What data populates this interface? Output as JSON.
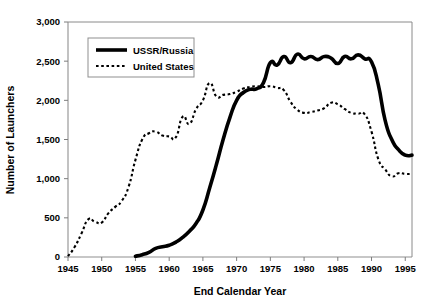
{
  "chart_data": {
    "type": "line",
    "title": "",
    "subtitle": "",
    "xlabel": "End Calendar Year",
    "ylabel": "Number of Launchers",
    "xlim": [
      1945,
      1996
    ],
    "ylim": [
      0,
      3000
    ],
    "xticks": [
      1945,
      1950,
      1955,
      1960,
      1965,
      1970,
      1975,
      1980,
      1985,
      1990,
      1995
    ],
    "xticklabels": [
      "1945",
      "1950",
      "1955",
      "1960",
      "1965",
      "1970",
      "1975",
      "1980",
      "1985",
      "1990",
      "1995"
    ],
    "yticks": [
      0,
      500,
      1000,
      1500,
      2000,
      2500,
      3000
    ],
    "yticklabels": [
      "0",
      "500",
      "1,000",
      "1,500",
      "2,000",
      "2,500",
      "3,000"
    ],
    "grid": false,
    "legend_position": "upper-left-inside",
    "series": [
      {
        "name": "USSR/Russia",
        "style": "solid",
        "linewidth": "thick",
        "color": "#000000",
        "x": [
          1955,
          1956,
          1957,
          1958,
          1959,
          1960,
          1961,
          1962,
          1963,
          1964,
          1965,
          1966,
          1967,
          1968,
          1969,
          1970,
          1971,
          1972,
          1973,
          1974,
          1975,
          1976,
          1977,
          1978,
          1979,
          1980,
          1981,
          1982,
          1983,
          1984,
          1985,
          1986,
          1987,
          1988,
          1989,
          1990,
          1991,
          1992,
          1993,
          1994,
          1995,
          1996
        ],
        "y": [
          10,
          30,
          60,
          110,
          130,
          150,
          190,
          250,
          330,
          430,
          600,
          880,
          1180,
          1500,
          1780,
          2000,
          2100,
          2140,
          2150,
          2230,
          2480,
          2450,
          2560,
          2480,
          2590,
          2530,
          2560,
          2520,
          2560,
          2540,
          2470,
          2560,
          2530,
          2580,
          2530,
          2490,
          2200,
          1750,
          1500,
          1370,
          1300,
          1300
        ]
      },
      {
        "name": "United States",
        "style": "dotted",
        "linewidth": "thin",
        "color": "#000000",
        "x": [
          1945,
          1946,
          1947,
          1948,
          1949,
          1950,
          1951,
          1952,
          1953,
          1954,
          1955,
          1956,
          1957,
          1958,
          1959,
          1960,
          1961,
          1962,
          1963,
          1964,
          1965,
          1966,
          1967,
          1968,
          1969,
          1970,
          1971,
          1972,
          1973,
          1974,
          1975,
          1976,
          1977,
          1978,
          1979,
          1980,
          1981,
          1982,
          1983,
          1984,
          1985,
          1986,
          1987,
          1988,
          1989,
          1990,
          1991,
          1992,
          1993,
          1994,
          1995,
          1996
        ],
        "y": [
          10,
          130,
          300,
          480,
          450,
          440,
          560,
          640,
          720,
          900,
          1240,
          1500,
          1580,
          1600,
          1550,
          1540,
          1530,
          1790,
          1700,
          1890,
          2000,
          2220,
          2050,
          2070,
          2080,
          2110,
          2150,
          2170,
          2180,
          2170,
          2180,
          2160,
          2130,
          1980,
          1880,
          1840,
          1850,
          1870,
          1900,
          1970,
          1950,
          1890,
          1840,
          1830,
          1820,
          1600,
          1250,
          1120,
          1030,
          1070,
          1060,
          1060
        ]
      }
    ],
    "legend": [
      {
        "label": "USSR/Russia",
        "style": "solid"
      },
      {
        "label": "United States",
        "style": "dotted"
      }
    ]
  }
}
